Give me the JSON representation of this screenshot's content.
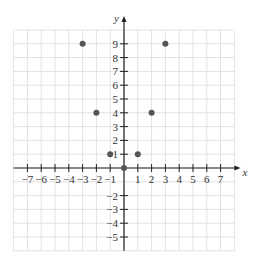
{
  "chart_data": {
    "type": "scatter",
    "title": "",
    "xlabel": "x",
    "ylabel": "y",
    "xlim": [
      -8,
      8
    ],
    "ylim": [
      -6,
      10
    ],
    "grid": true,
    "x_ticks": [
      -7,
      -6,
      -5,
      -4,
      -3,
      -2,
      -1,
      1,
      2,
      3,
      4,
      5,
      6,
      7
    ],
    "y_ticks": [
      -5,
      -4,
      -3,
      -2,
      1,
      2,
      3,
      4,
      5,
      6,
      7,
      8,
      9
    ],
    "points": [
      {
        "x": -3,
        "y": 9
      },
      {
        "x": -2,
        "y": 4
      },
      {
        "x": -1,
        "y": 1
      },
      {
        "x": 0,
        "y": 0
      },
      {
        "x": 1,
        "y": 1
      },
      {
        "x": 2,
        "y": 4
      },
      {
        "x": 3,
        "y": 9
      }
    ],
    "point_color": "#555555"
  }
}
